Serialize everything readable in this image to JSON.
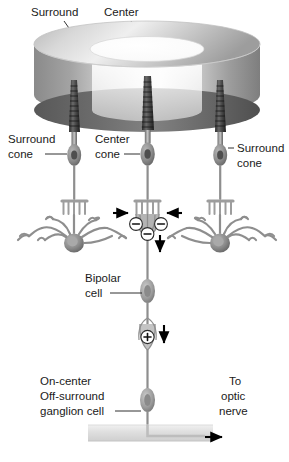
{
  "figure": {
    "background_color": "#ffffff"
  },
  "stimulus": {
    "surround_label": "Surround",
    "center_label": "Center",
    "surround_ring_color": "#a8a8a8",
    "center_disc_color": "#fbfbfb",
    "cylinder_body_color": "#9a9a9a",
    "base_shadow_color": "#6f6f6f"
  },
  "photoreceptors": {
    "left_cone_label_line1": "Surround",
    "left_cone_label_line2": "cone",
    "center_cone_label_line1": "Center",
    "center_cone_label_line2": "cone",
    "right_cone_label_line1": "Surround",
    "right_cone_label_line2": "cone",
    "cone_color": "#909090",
    "outer_segment_color": "#3d3d3d"
  },
  "synapse": {
    "sign_left": "−",
    "sign_right": "−",
    "sign_center": "−",
    "sign_bipolar": "+",
    "arrow_left_direction": "right",
    "arrow_right_direction": "left",
    "arrow_down_direction": "down",
    "arrow_bipolar_direction": "down"
  },
  "cells": {
    "bipolar_label_line1": "Bipolar",
    "bipolar_label_line2": "cell",
    "ganglion_label_line1": "On-center",
    "ganglion_label_line2": "Off-surround",
    "ganglion_label_line3": "ganglion cell",
    "horizontal_cell_color": "#8a8a8a",
    "soma_color": "#7d7d7d"
  },
  "output": {
    "optic_nerve_label_line1": "To",
    "optic_nerve_label_line2": "optic",
    "optic_nerve_label_line3": "nerve",
    "nerve_band_color": "#e2e2e2",
    "arrow_direction": "right"
  }
}
